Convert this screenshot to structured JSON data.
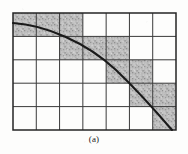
{
  "figure": {
    "caption": "(a)",
    "kind": "grid-quantized-curve-diagram",
    "geometry": {
      "grid_left": 13,
      "grid_top": 13,
      "grid_right": 176,
      "grid_bottom": 130,
      "columns": 7,
      "rows": 5,
      "cell_width": 23.28,
      "cell_height": 23.4
    },
    "colors": {
      "ink": "#2a2a2a",
      "grid_line": "#3a3a3a",
      "border_line": "#242424",
      "curve": "#1a1a1a",
      "shade_fill": "#b9b9b9",
      "shade_speckle_dark": "#8e8e8e",
      "shade_speckle_light": "#d8d8d8",
      "paper": "#fdfdfc"
    },
    "line_widths": {
      "border": 1.5,
      "grid": 1.0,
      "curve": 2.1
    },
    "shaded_cells": [
      {
        "row": 1,
        "col": 1
      },
      {
        "row": 1,
        "col": 2
      },
      {
        "row": 1,
        "col": 3
      },
      {
        "row": 2,
        "col": 3
      },
      {
        "row": 2,
        "col": 4
      },
      {
        "row": 2,
        "col": 5
      },
      {
        "row": 3,
        "col": 5
      },
      {
        "row": 3,
        "col": 6
      },
      {
        "row": 4,
        "col": 6
      },
      {
        "row": 4,
        "col": 7
      },
      {
        "row": 5,
        "col": 7
      }
    ],
    "curve": {
      "type": "concave-decreasing",
      "start_point": {
        "x": 13,
        "y": 23
      },
      "end_point": {
        "x": 172,
        "y": 130
      },
      "path": "M 13 23 C 45 25, 86 42, 116 70 C 140 93, 160 116, 172 130",
      "sampled_points": [
        {
          "x": 13,
          "y": 23
        },
        {
          "x": 36,
          "y": 26
        },
        {
          "x": 59,
          "y": 33
        },
        {
          "x": 82,
          "y": 44
        },
        {
          "x": 105,
          "y": 59
        },
        {
          "x": 128,
          "y": 79
        },
        {
          "x": 151,
          "y": 103
        },
        {
          "x": 172,
          "y": 130
        }
      ]
    },
    "caption_position": {
      "x": 94,
      "y": 140
    }
  }
}
